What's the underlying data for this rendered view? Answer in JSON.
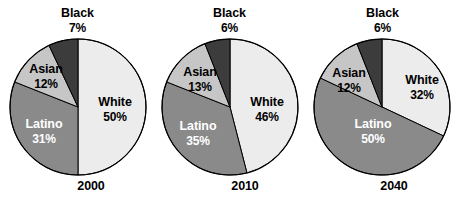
{
  "chart_data": {
    "type": "pie",
    "title": "",
    "subtitle": "",
    "xlabel": "",
    "ylabel": "",
    "legend_position": "none",
    "grid": false,
    "value_suffix": "%",
    "start_angle_deg": 0,
    "direction": "clockwise",
    "categories": [
      "White",
      "Latino",
      "Asian",
      "Black"
    ],
    "colors": {
      "White": "#ececec",
      "Latino": "#8a8a8a",
      "Asian": "#c6c6c6",
      "Black": "#3c3c3c",
      "outline": "#000000",
      "background": "#ffffff"
    },
    "charts": [
      {
        "year": "2000",
        "slices": [
          {
            "name": "White",
            "value": 50,
            "label": "White",
            "pct": "50%"
          },
          {
            "name": "Latino",
            "value": 31,
            "label": "Latino",
            "pct": "31%"
          },
          {
            "name": "Asian",
            "value": 12,
            "label": "Asian",
            "pct": "12%"
          },
          {
            "name": "Black",
            "value": 7,
            "label": "Black",
            "pct": "7%"
          }
        ]
      },
      {
        "year": "2010",
        "slices": [
          {
            "name": "White",
            "value": 46,
            "label": "White",
            "pct": "46%"
          },
          {
            "name": "Latino",
            "value": 35,
            "label": "Latino",
            "pct": "35%"
          },
          {
            "name": "Asian",
            "value": 13,
            "label": "Asian",
            "pct": "13%"
          },
          {
            "name": "Black",
            "value": 6,
            "label": "Black",
            "pct": "6%"
          }
        ]
      },
      {
        "year": "2040",
        "slices": [
          {
            "name": "White",
            "value": 32,
            "label": "White",
            "pct": "32%"
          },
          {
            "name": "Latino",
            "value": 50,
            "label": "Latino",
            "pct": "50%"
          },
          {
            "name": "Asian",
            "value": 12,
            "label": "Asian",
            "pct": "12%"
          },
          {
            "name": "Black",
            "value": 6,
            "label": "Black",
            "pct": "6%"
          }
        ]
      }
    ]
  },
  "panels": [
    {
      "year": "2000",
      "black_label": "Black",
      "black_pct": "7%",
      "asian_label": "Asian",
      "asian_pct": "12%",
      "latino_label": "Latino",
      "latino_pct": "31%",
      "white_label": "White",
      "white_pct": "50%"
    },
    {
      "year": "2010",
      "black_label": "Black",
      "black_pct": "6%",
      "asian_label": "Asian",
      "asian_pct": "13%",
      "latino_label": "Latino",
      "latino_pct": "35%",
      "white_label": "White",
      "white_pct": "46%"
    },
    {
      "year": "2040",
      "black_label": "Black",
      "black_pct": "6%",
      "asian_label": "Asian",
      "asian_pct": "12%",
      "latino_label": "Latino",
      "latino_pct": "50%",
      "white_label": "White",
      "white_pct": "32%"
    }
  ]
}
